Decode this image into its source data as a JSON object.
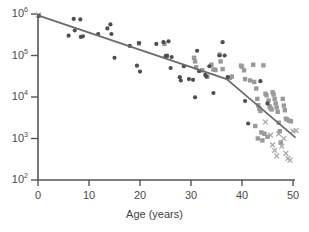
{
  "chart_data": {
    "type": "scatter",
    "title": "",
    "xlabel": "Age (years)",
    "ylabel": "",
    "xlim": [
      0,
      51
    ],
    "ylim": [
      100,
      1000000
    ],
    "yscale": "log",
    "grid": false,
    "legend": "none",
    "xticks": [
      0,
      10,
      20,
      30,
      40,
      50
    ],
    "xtick_labels": [
      "0",
      "10",
      "20",
      "30",
      "40",
      "50"
    ],
    "yticks": [
      100,
      1000,
      10000,
      100000,
      1000000
    ],
    "ytick_labels": [
      "10",
      "10",
      "10",
      "10",
      "10"
    ],
    "ytick_exponents": [
      "2",
      "3",
      "4",
      "5",
      "6"
    ],
    "colors": {
      "circle_series": "#4d4d52",
      "square_series": "#9a9a9a",
      "cross_series": "#a8a8a8",
      "trend_line": "#6b6b6b",
      "axis": "#555555"
    },
    "series": [
      {
        "name": "circles",
        "marker": "circle",
        "color": "#4d4d52",
        "points": [
          [
            0.2,
            900000
          ],
          [
            6.0,
            300000
          ],
          [
            7.0,
            760000
          ],
          [
            7.2,
            400000
          ],
          [
            8.3,
            740000
          ],
          [
            8.4,
            280000
          ],
          [
            8.8,
            290000
          ],
          [
            11.8,
            330000
          ],
          [
            13.6,
            450000
          ],
          [
            14.2,
            560000
          ],
          [
            14.4,
            330000
          ],
          [
            15.0,
            88000
          ],
          [
            18.0,
            170000
          ],
          [
            19.4,
            57000
          ],
          [
            19.8,
            200000
          ],
          [
            20.0,
            41000
          ],
          [
            23.2,
            190000
          ],
          [
            24.6,
            210000
          ],
          [
            25.0,
            95000
          ],
          [
            25.3,
            98000
          ],
          [
            25.6,
            220000
          ],
          [
            26.0,
            50000
          ],
          [
            26.2,
            92000
          ],
          [
            27.8,
            30000
          ],
          [
            28.0,
            25000
          ],
          [
            28.6,
            55000
          ],
          [
            29.6,
            27000
          ],
          [
            30.4,
            26000
          ],
          [
            30.8,
            9800
          ],
          [
            31.2,
            130000
          ],
          [
            31.6,
            42000
          ],
          [
            32.8,
            34000
          ],
          [
            33.0,
            31000
          ],
          [
            33.6,
            55000
          ],
          [
            34.4,
            12500
          ],
          [
            35.6,
            100000
          ],
          [
            36.2,
            210000
          ],
          [
            36.6,
            100000
          ],
          [
            37.2,
            30000
          ],
          [
            40.6,
            8000
          ],
          [
            41.2,
            2300
          ],
          [
            43.6,
            24000
          ],
          [
            45.0,
            7000
          ]
        ]
      },
      {
        "name": "squares",
        "marker": "square",
        "color": "#9a9a9a",
        "points": [
          [
            19.8,
            195000
          ],
          [
            24.8,
            190000
          ],
          [
            25.2,
            98000
          ],
          [
            30.6,
            88000
          ],
          [
            30.8,
            72000
          ],
          [
            31.0,
            52000
          ],
          [
            32.2,
            44000
          ],
          [
            33.2,
            31000
          ],
          [
            34.0,
            60000
          ],
          [
            34.4,
            46000
          ],
          [
            34.8,
            45000
          ],
          [
            35.6,
            105000
          ],
          [
            35.8,
            72000
          ],
          [
            36.2,
            47000
          ],
          [
            37.6,
            29000
          ],
          [
            38.0,
            31000
          ],
          [
            39.8,
            57000
          ],
          [
            40.0,
            54000
          ],
          [
            40.4,
            44000
          ],
          [
            40.6,
            27000
          ],
          [
            41.6,
            25000
          ],
          [
            42.2,
            60000
          ],
          [
            42.4,
            23000
          ],
          [
            42.8,
            16000
          ],
          [
            43.0,
            9000
          ],
          [
            43.2,
            6300
          ],
          [
            43.4,
            5200
          ],
          [
            43.6,
            4600
          ],
          [
            43.8,
            1400
          ],
          [
            44.0,
            900
          ],
          [
            44.2,
            58000
          ],
          [
            44.6,
            12000
          ],
          [
            44.8,
            11000
          ],
          [
            45.2,
            8200
          ],
          [
            45.4,
            6000
          ],
          [
            45.6,
            5400
          ],
          [
            45.8,
            5000
          ],
          [
            46.0,
            13000
          ],
          [
            46.2,
            11500
          ],
          [
            46.4,
            9000
          ],
          [
            46.6,
            7000
          ],
          [
            46.8,
            5600
          ],
          [
            47.0,
            4400
          ],
          [
            47.2,
            2400
          ],
          [
            47.4,
            1500
          ],
          [
            47.6,
            800
          ],
          [
            48.0,
            9000
          ],
          [
            48.2,
            6200
          ],
          [
            48.4,
            4800
          ],
          [
            48.6,
            3000
          ],
          [
            48.8,
            2900
          ],
          [
            49.2,
            2700
          ],
          [
            49.6,
            2600
          ],
          [
            42.6,
            2000
          ],
          [
            44.4,
            1300
          ],
          [
            45.0,
            1100
          ],
          [
            43.1,
            1000
          ]
        ]
      },
      {
        "name": "crosses",
        "marker": "x",
        "color": "#a8a8a8",
        "points": [
          [
            0.1,
            950000
          ],
          [
            44.6,
            2500
          ],
          [
            45.6,
            1200
          ],
          [
            46.0,
            700
          ],
          [
            46.4,
            520
          ],
          [
            46.8,
            380
          ],
          [
            47.2,
            1300
          ],
          [
            47.8,
            650
          ],
          [
            48.2,
            1000
          ],
          [
            48.6,
            440
          ],
          [
            49.0,
            330
          ],
          [
            49.4,
            300
          ],
          [
            50.0,
            1500
          ],
          [
            50.6,
            1550
          ]
        ]
      }
    ],
    "trend_line": {
      "name": "fitted-trend",
      "color": "#6b6b6b",
      "points": [
        [
          0.0,
          930000
        ],
        [
          37.0,
          27000
        ],
        [
          50.5,
          1050
        ]
      ]
    }
  }
}
